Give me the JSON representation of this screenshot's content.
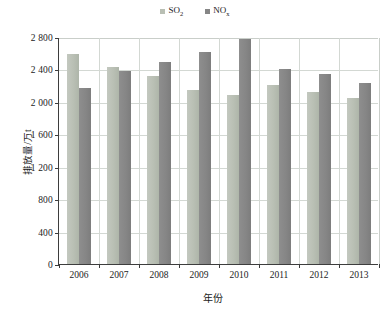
{
  "legend": {
    "position": "top-center",
    "entries": [
      {
        "label": "SO",
        "sub": "2",
        "name": "legend-so2",
        "color": "#b9bfb4"
      },
      {
        "label": "NO",
        "sub": "x",
        "name": "legend-nox",
        "color": "#868686"
      }
    ]
  },
  "axes": {
    "x_title": "年份",
    "y_title": "排放量/万t",
    "y_ticks": [
      "0",
      "400",
      "800",
      "1 200",
      "1 600",
      "2 000",
      "2 400",
      "2 800"
    ],
    "x_ticks": [
      "2006",
      "2007",
      "2008",
      "2009",
      "2010",
      "2011",
      "2012",
      "2013"
    ]
  },
  "chart_data": {
    "type": "bar",
    "title": "",
    "subtitle": "",
    "xlabel": "年份",
    "ylabel": "排放量/万t",
    "categories": [
      "2006",
      "2007",
      "2008",
      "2009",
      "2010",
      "2011",
      "2012",
      "2013"
    ],
    "series": [
      {
        "name": "SO2",
        "legend": "SO₂",
        "color": "#b9bfb4",
        "values": [
          2589,
          2428,
          2321,
          2141,
          2086,
          2212,
          2118,
          2044
        ]
      },
      {
        "name": "NOx",
        "legend": "NOₓ",
        "color": "#868686",
        "values": [
          2174,
          2382,
          2492,
          2620,
          2774,
          2404,
          2338,
          2228
        ]
      }
    ],
    "ylim": [
      0,
      2800
    ],
    "ytick_step": 400,
    "grid": "horizontal-and-vertical",
    "legend_position": "top-center",
    "bar_group_gap": true
  }
}
